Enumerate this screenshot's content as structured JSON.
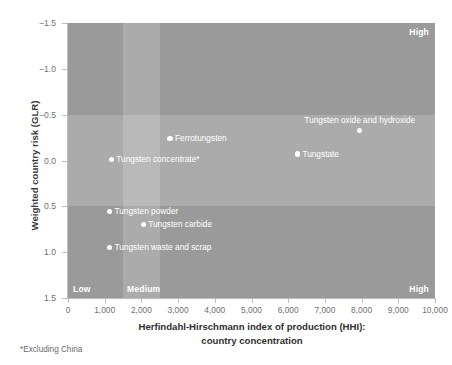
{
  "chart_data": {
    "type": "scatter",
    "title": "",
    "xlabel": "Herfindahl-Hirschmann index of production (HHI): country concentration",
    "xlabel_line1": "Herfindahl-Hirschmann index of production (HHI):",
    "xlabel_line2": "country concentration",
    "ylabel": "Weighted country risk (GLR)",
    "xlim": [
      0,
      10000
    ],
    "ylim": [
      1.5,
      -1.5
    ],
    "y_axis_inverted": true,
    "grid": false,
    "legend_position": "none",
    "xticks": [
      0,
      1000,
      2000,
      3000,
      4000,
      5000,
      6000,
      7000,
      8000,
      9000,
      10000
    ],
    "xtick_labels": [
      "0",
      "1,000",
      "2,000",
      "3,000",
      "4,000",
      "5,000",
      "6,000",
      "7,000",
      "8,000",
      "9,000",
      "10,000"
    ],
    "yticks": [
      -1.5,
      -1.0,
      -0.5,
      0.0,
      0.5,
      1.0,
      1.5
    ],
    "ytick_labels": [
      "−1.5",
      "−1.0",
      "−0.5",
      "0.0",
      "0.5",
      "1.0",
      "1.5"
    ],
    "background_bands": {
      "vertical_medium_band": [
        1500,
        2500
      ],
      "horizontal_mid_band": [
        -0.5,
        0.5
      ],
      "base_color": "#9a9a9a",
      "highlight_color": "rgba(255,255,255,0.17)"
    },
    "zone_labels": [
      {
        "text": "High",
        "x_pos": "right",
        "y_pos": "top"
      },
      {
        "text": "Low",
        "x_pos": "left",
        "y_pos": "bottom"
      },
      {
        "text": "Medium",
        "x_pos": "medium",
        "y_pos": "bottom"
      },
      {
        "text": "High",
        "x_pos": "right",
        "y_pos": "bottom"
      }
    ],
    "marker_color": "#ffffff",
    "label_color": "#ffffff",
    "points": [
      {
        "label": "Tungsten oxide and hydroxide",
        "x": 7950,
        "y": -0.33,
        "label_pos": "above"
      },
      {
        "label": "Tungstate",
        "x": 6250,
        "y": -0.07,
        "label_pos": "right"
      },
      {
        "label": "Ferrotungsten",
        "x": 2780,
        "y": -0.24,
        "label_pos": "right"
      },
      {
        "label": "Tungsten concentrate*",
        "x": 1180,
        "y": -0.01,
        "label_pos": "right"
      },
      {
        "label": "Tungsten powder",
        "x": 1130,
        "y": 0.56,
        "label_pos": "right"
      },
      {
        "label": "Tungsten carbide",
        "x": 2050,
        "y": 0.7,
        "label_pos": "right"
      },
      {
        "label": "Tungsten waste and scrap",
        "x": 1130,
        "y": 0.95,
        "label_pos": "right"
      }
    ]
  },
  "footnote": "*Excluding China"
}
